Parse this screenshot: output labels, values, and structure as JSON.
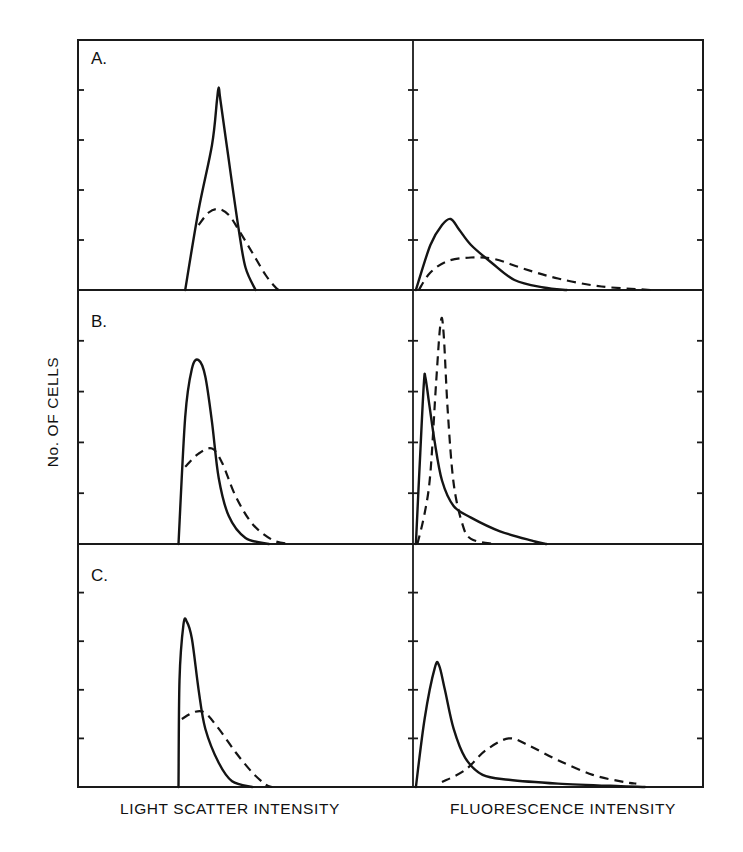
{
  "chart_data": {
    "type": "line",
    "layout": "3 rows x 2 columns of histogram panels sharing a frame",
    "ylabel": "No. OF CELLS",
    "xlabels": [
      "LIGHT SCATTER INTENSITY",
      "FLUORESCENCE INTENSITY"
    ],
    "y_ticks_per_panel": 4,
    "y_units": "tick intervals (0 = baseline, 5 = panel top); no numeric tick labels shown",
    "x_units": "relative intensity 0-100 across each panel width; no numeric tick labels shown",
    "grid": false,
    "legend": "none (solid vs dashed distinguish two populations)",
    "panels": [
      {
        "id": "A",
        "label": "A.",
        "row": 0,
        "col": 0,
        "xlabel": "LIGHT SCATTER INTENSITY",
        "series": [
          {
            "name": "solid",
            "style": "solid",
            "points": [
              [
                32,
                0
              ],
              [
                36,
                1.6
              ],
              [
                40,
                2.9
              ],
              [
                41.5,
                3.8
              ],
              [
                42,
                4.05
              ],
              [
                42.5,
                3.8
              ],
              [
                45,
                2.6
              ],
              [
                48,
                1.2
              ],
              [
                50,
                0.45
              ],
              [
                53,
                0
              ]
            ]
          },
          {
            "name": "dashed",
            "style": "dashed",
            "points": [
              [
                36,
                1.3
              ],
              [
                39,
                1.55
              ],
              [
                42,
                1.62
              ],
              [
                45,
                1.5
              ],
              [
                48,
                1.2
              ],
              [
                52,
                0.75
              ],
              [
                56,
                0.3
              ],
              [
                59,
                0.05
              ],
              [
                60,
                0
              ]
            ]
          }
        ]
      },
      {
        "id": "A-fluor",
        "label": "",
        "row": 0,
        "col": 1,
        "xlabel": "FLUORESCENCE INTENSITY",
        "series": [
          {
            "name": "solid",
            "style": "solid",
            "points": [
              [
                1,
                0
              ],
              [
                6,
                0.9
              ],
              [
                10,
                1.3
              ],
              [
                13,
                1.42
              ],
              [
                16,
                1.2
              ],
              [
                20,
                0.9
              ],
              [
                27,
                0.55
              ],
              [
                35,
                0.2
              ],
              [
                45,
                0.05
              ],
              [
                53,
                0
              ]
            ]
          },
          {
            "name": "dashed",
            "style": "dashed",
            "points": [
              [
                2,
                0
              ],
              [
                6,
                0.35
              ],
              [
                12,
                0.58
              ],
              [
                20,
                0.65
              ],
              [
                28,
                0.62
              ],
              [
                38,
                0.43
              ],
              [
                50,
                0.23
              ],
              [
                65,
                0.07
              ],
              [
                82,
                0
              ]
            ]
          }
        ]
      },
      {
        "id": "B",
        "label": "B.",
        "row": 1,
        "col": 0,
        "xlabel": "LIGHT SCATTER INTENSITY",
        "series": [
          {
            "name": "solid",
            "style": "solid",
            "points": [
              [
                30,
                0
              ],
              [
                32,
                2.5
              ],
              [
                34,
                3.45
              ],
              [
                36,
                3.62
              ],
              [
                38,
                3.3
              ],
              [
                40,
                2.4
              ],
              [
                42,
                1.3
              ],
              [
                45,
                0.55
              ],
              [
                50,
                0.12
              ],
              [
                57,
                0
              ]
            ]
          },
          {
            "name": "dashed",
            "style": "dashed",
            "points": [
              [
                32,
                1.52
              ],
              [
                36,
                1.78
              ],
              [
                40,
                1.88
              ],
              [
                43,
                1.6
              ],
              [
                47,
                0.95
              ],
              [
                52,
                0.4
              ],
              [
                58,
                0.08
              ],
              [
                63,
                0
              ]
            ]
          }
        ]
      },
      {
        "id": "B-fluor",
        "label": "",
        "row": 1,
        "col": 1,
        "xlabel": "FLUORESCENCE INTENSITY",
        "series": [
          {
            "name": "solid",
            "style": "solid",
            "points": [
              [
                1,
                0
              ],
              [
                2.5,
                1.8
              ],
              [
                3.8,
                3.2
              ],
              [
                4.3,
                3.27
              ],
              [
                5.5,
                2.8
              ],
              [
                7.5,
                2.0
              ],
              [
                10,
                1.25
              ],
              [
                14,
                0.75
              ],
              [
                20,
                0.52
              ],
              [
                30,
                0.25
              ],
              [
                42,
                0.05
              ],
              [
                46,
                0
              ]
            ]
          },
          {
            "name": "dashed",
            "style": "dashed",
            "points": [
              [
                1.5,
                0
              ],
              [
                4,
                0.6
              ],
              [
                6,
                1.4
              ],
              [
                8,
                3.2
              ],
              [
                9.5,
                4.35
              ],
              [
                10.5,
                4.2
              ],
              [
                12,
                2.6
              ],
              [
                14,
                1.2
              ],
              [
                17,
                0.4
              ],
              [
                20,
                0.1
              ],
              [
                28,
                0
              ]
            ]
          }
        ]
      },
      {
        "id": "C",
        "label": "C.",
        "row": 2,
        "col": 0,
        "xlabel": "LIGHT SCATTER INTENSITY",
        "series": [
          {
            "name": "solid",
            "style": "solid",
            "points": [
              [
                30,
                0
              ],
              [
                30.3,
                2.2
              ],
              [
                31.5,
                3.35
              ],
              [
                32.5,
                3.4
              ],
              [
                34,
                3.05
              ],
              [
                36,
                2.0
              ],
              [
                38,
                1.2
              ],
              [
                42,
                0.5
              ],
              [
                46,
                0.12
              ],
              [
                52,
                0
              ]
            ]
          },
          {
            "name": "dashed",
            "style": "dashed",
            "points": [
              [
                31,
                1.4
              ],
              [
                35,
                1.55
              ],
              [
                38,
                1.52
              ],
              [
                42,
                1.2
              ],
              [
                47,
                0.72
              ],
              [
                52,
                0.3
              ],
              [
                56,
                0.05
              ],
              [
                58,
                0
              ]
            ]
          }
        ]
      },
      {
        "id": "C-fluor",
        "label": "",
        "row": 2,
        "col": 1,
        "xlabel": "FLUORESCENCE INTENSITY",
        "series": [
          {
            "name": "solid",
            "style": "solid",
            "points": [
              [
                1,
                0
              ],
              [
                4,
                1.4
              ],
              [
                7.5,
                2.45
              ],
              [
                9,
                2.5
              ],
              [
                11,
                2.0
              ],
              [
                14,
                1.2
              ],
              [
                18,
                0.6
              ],
              [
                24,
                0.25
              ],
              [
                33,
                0.15
              ],
              [
                50,
                0.07
              ],
              [
                70,
                0.02
              ],
              [
                80,
                0
              ]
            ]
          },
          {
            "name": "dashed",
            "style": "dashed",
            "points": [
              [
                10,
                0.1
              ],
              [
                18,
                0.35
              ],
              [
                25,
                0.75
              ],
              [
                33,
                1.0
              ],
              [
                40,
                0.85
              ],
              [
                50,
                0.55
              ],
              [
                62,
                0.25
              ],
              [
                73,
                0.1
              ],
              [
                77,
                0.07
              ]
            ]
          }
        ]
      }
    ]
  },
  "figure": {
    "ylabel": "No. OF CELLS",
    "xlabel_left": "LIGHT SCATTER INTENSITY",
    "xlabel_right": "FLUORESCENCE INTENSITY",
    "panel_labels": [
      "A.",
      "B.",
      "C."
    ]
  }
}
